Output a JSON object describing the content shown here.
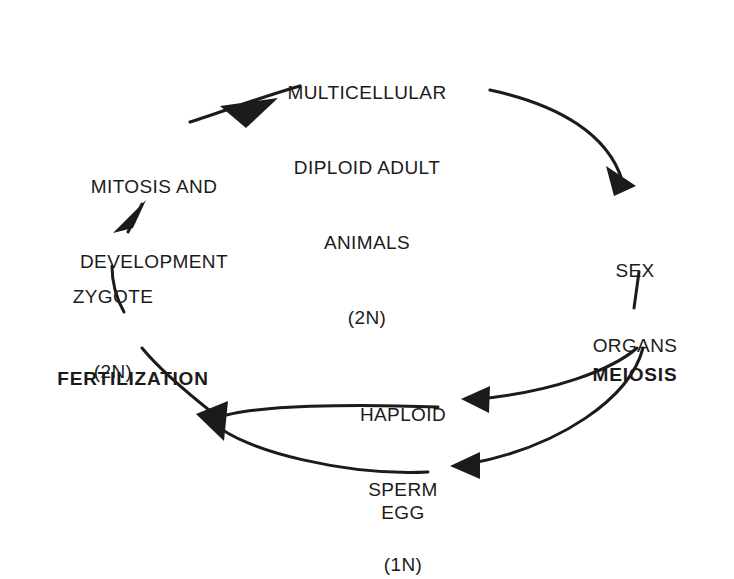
{
  "diagram": {
    "type": "cycle-diagram",
    "stroke_color": "#1b1b1b",
    "background_color": "#ffffff",
    "nodes": {
      "adult": {
        "lines": [
          "MULTICELLULAR",
          "DIPLOID ADULT",
          "ANIMALS",
          "(2N)"
        ],
        "ploidy": "2N",
        "emphasis": "normal"
      },
      "sex_organs": {
        "lines": [
          "SEX",
          "ORGANS"
        ],
        "emphasis": "normal"
      },
      "meiosis": {
        "lines": [
          "MEIOSIS"
        ],
        "emphasis": "bold"
      },
      "sperm": {
        "lines": [
          "HAPLOID",
          "SPERM",
          "(1N)"
        ],
        "ploidy": "1N",
        "emphasis": "normal"
      },
      "egg": {
        "lines": [
          "EGG"
        ],
        "emphasis": "normal"
      },
      "fertilization": {
        "lines": [
          "FERTILIZATION"
        ],
        "emphasis": "bold"
      },
      "zygote": {
        "lines": [
          "ZYGOTE",
          "(2N)"
        ],
        "ploidy": "2N",
        "emphasis": "normal"
      },
      "mitosis": {
        "lines": [
          "MITOSIS AND",
          "DEVELOPMENT"
        ],
        "emphasis": "normal"
      }
    },
    "edges": [
      {
        "name": "adult-to-sex-organs",
        "from": "adult",
        "to": "sex_organs",
        "arrow": "down-right"
      },
      {
        "name": "meiosis-to-sperm",
        "from": "meiosis",
        "to": "sperm",
        "arrow": "left"
      },
      {
        "name": "meiosis-to-egg",
        "from": "meiosis",
        "to": "egg",
        "arrow": "left"
      },
      {
        "name": "sperm-to-fertilization",
        "from": "sperm",
        "to": "fertilization",
        "arrow": "up-left"
      },
      {
        "name": "egg-to-fertilization",
        "from": "egg",
        "to": "fertilization",
        "arrow": "up-left"
      },
      {
        "name": "fertilization-to-zygote",
        "from": "fertilization",
        "to": "zygote",
        "arrow": "none"
      },
      {
        "name": "zygote-to-mitosis",
        "from": "zygote",
        "to": "mitosis",
        "arrow": "up"
      },
      {
        "name": "mitosis-to-adult",
        "from": "mitosis",
        "to": "adult",
        "arrow": "up-left"
      }
    ]
  }
}
